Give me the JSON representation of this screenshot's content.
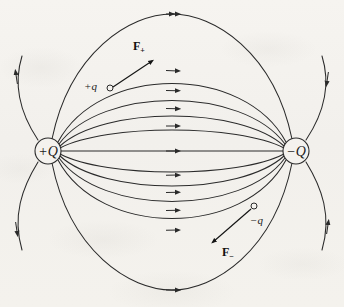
{
  "figure": {
    "background_color": "#f4f2ee",
    "ink_color": "#2a2a2a",
    "width": 344,
    "height": 307
  },
  "charges": [
    {
      "id": "positive-source",
      "label": "+Q",
      "sign": "+",
      "cx": 48,
      "cy": 151,
      "r": 13
    },
    {
      "id": "negative-source",
      "label": "−Q",
      "sign": "−",
      "cx": 296,
      "cy": 151,
      "r": 13
    }
  ],
  "test_charges": [
    {
      "id": "positive-test",
      "label": "+q",
      "label_x": 84,
      "label_y": 86,
      "marker_cx": 110,
      "marker_cy": 88,
      "marker_r": 3
    },
    {
      "id": "negative-test",
      "label": "−q",
      "label_x": 250,
      "label_y": 222,
      "marker_cx": 254,
      "marker_cy": 206,
      "marker_r": 3
    }
  ],
  "force_vectors": [
    {
      "id": "force-on-positive",
      "symbol": "F",
      "subscript": "+",
      "label_x": 133,
      "label_y": 50,
      "from_x": 113,
      "from_y": 87,
      "to_x": 153,
      "to_y": 60,
      "direction": "up-right, away from +Q"
    },
    {
      "id": "force-on-negative",
      "symbol": "F",
      "subscript": "−",
      "label_x": 224,
      "label_y": 254,
      "from_x": 251,
      "from_y": 209,
      "to_x": 212,
      "to_y": 243,
      "direction": "down-left, toward +Q"
    }
  ],
  "field_lines": {
    "count_total": 15,
    "inner_arc_count": 7,
    "outer_loop_count": 4,
    "straight_axis_line": true,
    "arrow_direction": "from +Q to −Q",
    "description": "Electric field lines of a dipole: seven arcs plus one straight axial line run between the charges, and four large outer loops wrap around the outside."
  }
}
